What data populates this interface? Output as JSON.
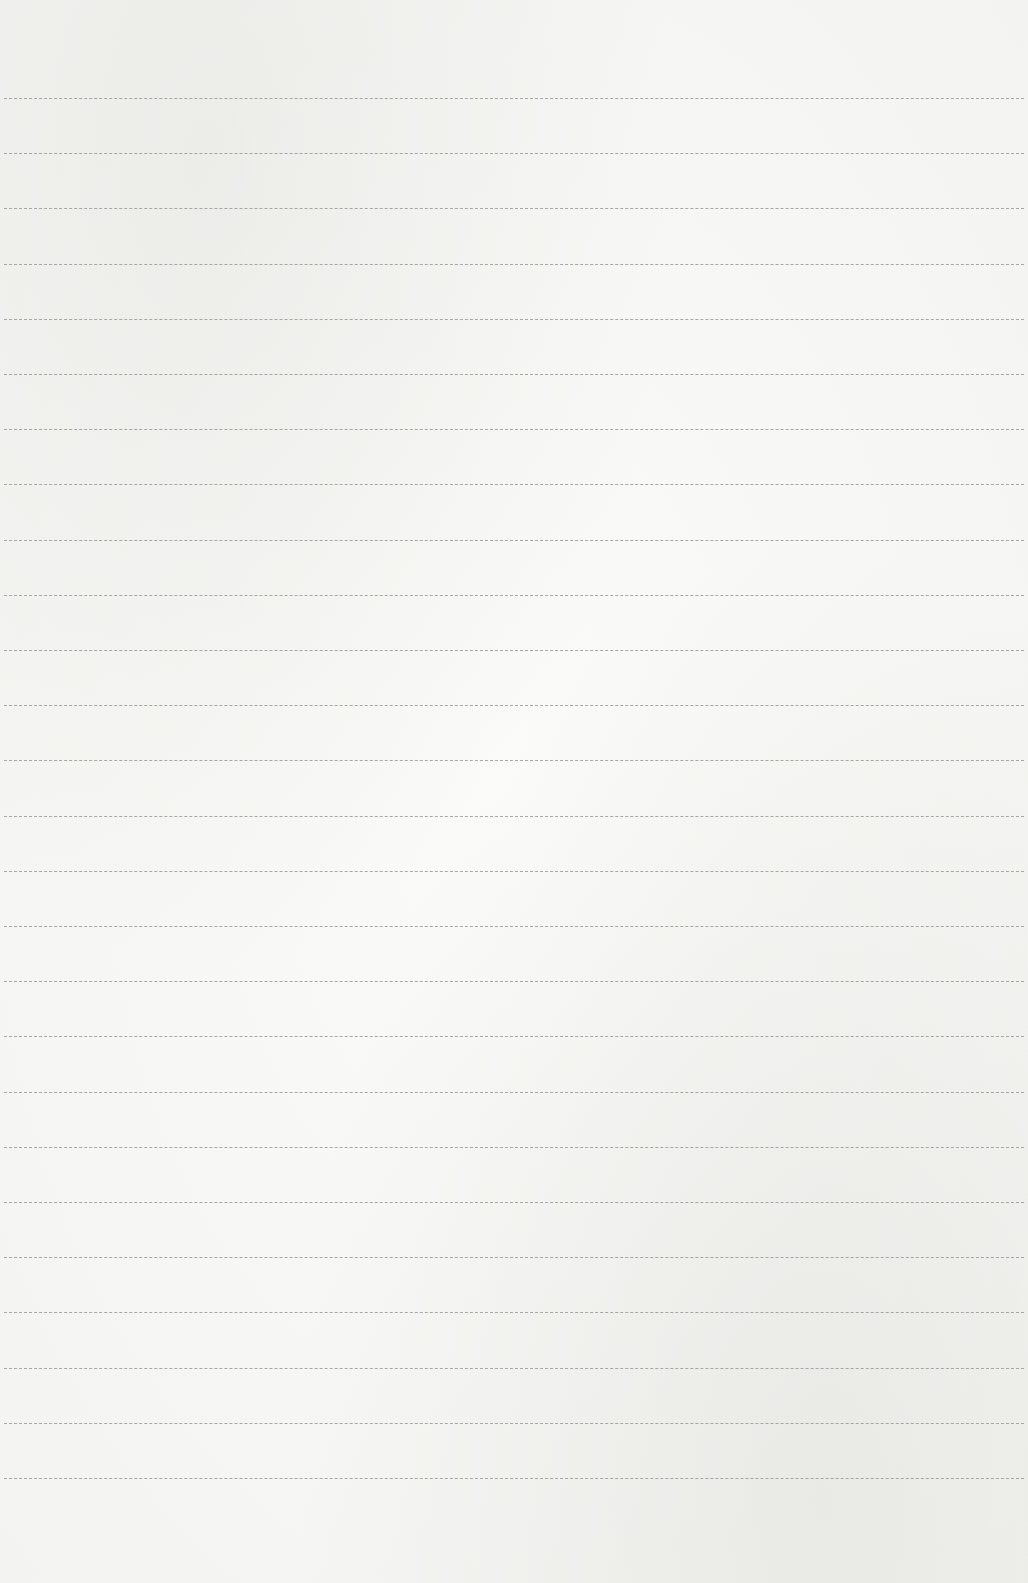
{
  "page": {
    "type": "blank ruled paper",
    "ruled_lines": {
      "count": 26,
      "first_y": 98,
      "spacing": 55.2,
      "color": "#9a9a98"
    },
    "background_color": "#f4f4f2",
    "text": ""
  }
}
